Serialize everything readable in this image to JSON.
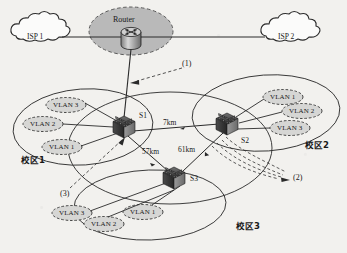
{
  "figure": {
    "type": "network-topology-diagram",
    "background_color": "#f2f1ee",
    "line_color": "#2a2a2a"
  },
  "clouds": [
    {
      "name": "isp-1",
      "label": "ISP 1",
      "x": 38,
      "y": 34
    },
    {
      "name": "isp-2",
      "label": "ISP 2",
      "x": 290,
      "y": 34
    }
  ],
  "router": {
    "label": "Router",
    "icon": "router-icon",
    "x": 131,
    "y": 32,
    "halo_fill": "#b9b9b9",
    "halo_stroke": "#555555"
  },
  "core": {
    "label": "core-network-ellipse"
  },
  "switches": [
    {
      "name": "switch-s1",
      "label": "S1",
      "x": 124,
      "y": 127,
      "label_x": 139,
      "label_y": 115
    },
    {
      "name": "switch-s2",
      "label": "S2",
      "x": 227,
      "y": 124,
      "label_x": 241,
      "label_y": 140
    },
    {
      "name": "switch-s3",
      "label": "S3",
      "x": 174,
      "y": 178,
      "label_x": 190,
      "label_y": 178
    }
  ],
  "links": [
    {
      "name": "link-s1-s2",
      "label": "7km",
      "label_x": 163,
      "label_y": 123
    },
    {
      "name": "link-s1-s3",
      "label": "57km",
      "label_x": 146,
      "label_y": 152
    },
    {
      "name": "link-s2-s3",
      "label": "61km",
      "label_x": 181,
      "label_y": 150
    }
  ],
  "campuses": [
    {
      "name": "campus-1",
      "label": "校区1",
      "label_x": 21,
      "label_y": 160,
      "vlans": [
        {
          "label": "VLAN 3",
          "x": 66,
          "y": 105
        },
        {
          "label": "VLAN 2",
          "x": 43,
          "y": 124
        },
        {
          "label": "VLAN 1",
          "x": 62,
          "y": 147
        }
      ]
    },
    {
      "name": "campus-2",
      "label": "校区2",
      "label_x": 307,
      "label_y": 145,
      "vlans": [
        {
          "label": "VLAN 1",
          "x": 283,
          "y": 97
        },
        {
          "label": "VLAN 2",
          "x": 302,
          "y": 111
        },
        {
          "label": "VLAN 3",
          "x": 290,
          "y": 128
        }
      ]
    },
    {
      "name": "campus-3",
      "label": "校区3",
      "label_x": 238,
      "label_y": 226,
      "vlans": [
        {
          "label": "VLAN 3",
          "x": 72,
          "y": 213
        },
        {
          "label": "VLAN 2",
          "x": 104,
          "y": 224
        },
        {
          "label": "VLAN 1",
          "x": 143,
          "y": 212
        }
      ]
    }
  ],
  "callouts": [
    {
      "name": "callout-1",
      "label": "(1)",
      "x": 185,
      "y": 64
    },
    {
      "name": "callout-2",
      "label": "(2)",
      "x": 295,
      "y": 178
    },
    {
      "name": "callout-3",
      "label": "(3)",
      "x": 63,
      "y": 194
    }
  ]
}
